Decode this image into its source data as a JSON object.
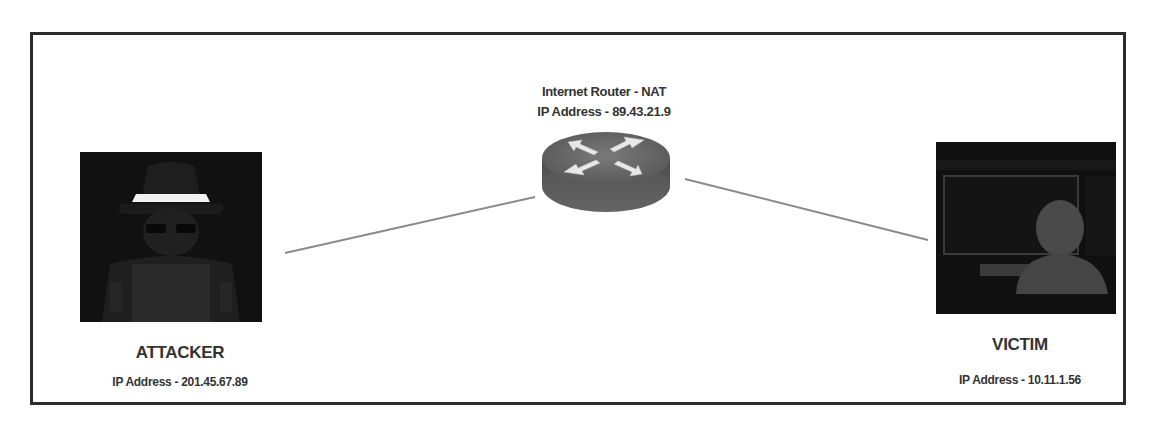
{
  "diagram": {
    "type": "network-topology",
    "router": {
      "title": "Internet Router - NAT",
      "ip_label": "IP Address - 89.43.21.9",
      "icon": "router-icon"
    },
    "attacker": {
      "name": "ATTACKER",
      "ip_label": "IP Address - 201.45.67.89",
      "icon": "hacker-icon"
    },
    "victim": {
      "name": "VICTIM",
      "ip_label": "IP Address - 10.11.1.56",
      "icon": "user-at-monitor-icon"
    },
    "links": [
      {
        "from": "attacker",
        "to": "router"
      },
      {
        "from": "router",
        "to": "victim"
      }
    ],
    "colors": {
      "frame": "#2b2b2b",
      "link": "#888888",
      "icon_bg": "#111111",
      "router_body": "#555555",
      "text": "#333333"
    }
  }
}
